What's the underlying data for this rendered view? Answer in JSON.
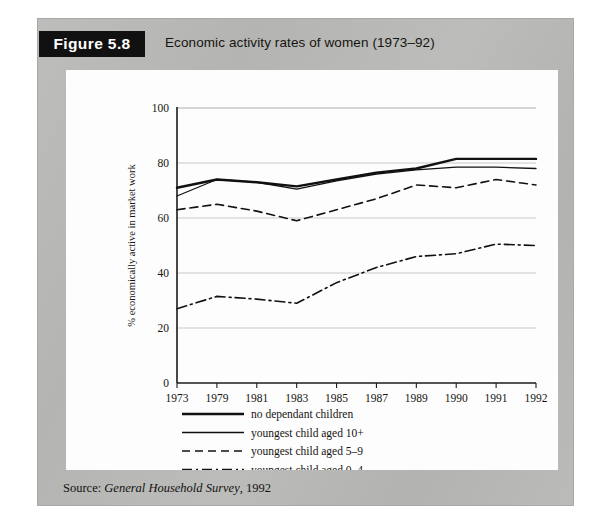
{
  "figure": {
    "number_label": "Figure 5.8",
    "caption": "Economic activity rates of women (1973–92)"
  },
  "source": {
    "prefix": "Source: ",
    "title": "General Household Survey",
    "suffix": ", 1992"
  },
  "chart_data": {
    "type": "line",
    "title": "Economic activity rates of women (1973–92)",
    "xlabel": "",
    "ylabel": "% economically active in market work",
    "categories": [
      "1973",
      "1979",
      "1981",
      "1983",
      "1985",
      "1987",
      "1989",
      "1990",
      "1991",
      "1992"
    ],
    "ylim": [
      0,
      100
    ],
    "yticks": [
      0,
      20,
      40,
      60,
      80,
      100
    ],
    "grid": true,
    "legend_position": "below",
    "series": [
      {
        "name": "no dependant children",
        "style": "solid-thick",
        "color": "#111111",
        "values": [
          71,
          74,
          73,
          71.5,
          74,
          76.5,
          78,
          81.5,
          81.5,
          81.5
        ]
      },
      {
        "name": "youngest child aged 10+",
        "style": "solid-thin",
        "color": "#111111",
        "values": [
          68,
          74,
          73,
          70.5,
          73.5,
          76,
          77.5,
          78.5,
          78.5,
          78
        ]
      },
      {
        "name": "youngest child aged 5–9",
        "style": "dashed",
        "color": "#111111",
        "values": [
          63,
          65,
          62.5,
          59,
          63,
          67,
          72,
          71,
          74,
          72
        ]
      },
      {
        "name": "youngest child aged 0–4",
        "style": "dash-dot",
        "color": "#111111",
        "values": [
          27,
          31.5,
          30.5,
          29,
          36.5,
          42,
          46,
          47,
          50.5,
          50
        ]
      }
    ]
  },
  "legend": {
    "items": [
      {
        "label": "no dependant children",
        "style": "solid-thick"
      },
      {
        "label": "youngest child aged 10+",
        "style": "solid-thin"
      },
      {
        "label": "youngest child aged 5–9",
        "style": "dashed"
      },
      {
        "label": "youngest child aged 0–4",
        "style": "dash-dot"
      }
    ]
  }
}
